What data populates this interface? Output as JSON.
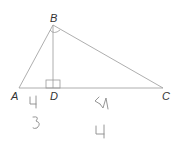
{
  "diagram": {
    "type": "right-triangle-with-altitude",
    "vertices": [
      {
        "name": "A",
        "label": "A"
      },
      {
        "name": "B",
        "label": "B"
      },
      {
        "name": "C",
        "label": "C"
      },
      {
        "name": "D",
        "label": "D"
      }
    ],
    "right_angles": [
      "ABC",
      "BDA"
    ],
    "segments": [
      "AB",
      "BC",
      "AC",
      "BD"
    ],
    "handwritten_annotations": [
      "4",
      "3",
      "51",
      "4"
    ],
    "colors": {
      "line": "#999999",
      "label": "#333333",
      "handwriting": "#8a8a8a"
    }
  }
}
